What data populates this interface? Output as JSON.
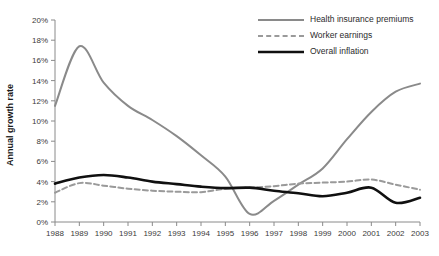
{
  "chart_data": {
    "type": "line",
    "title": "",
    "xlabel": "",
    "ylabel": "Annual growth rate",
    "x": [
      1988,
      1989,
      1990,
      1991,
      1992,
      1993,
      1994,
      1995,
      1996,
      1997,
      1998,
      1999,
      2000,
      2001,
      2002,
      2003
    ],
    "xtick_labels": [
      "1988",
      "1989",
      "1990",
      "1991",
      "1992",
      "1993",
      "1994",
      "1995",
      "1996",
      "1997",
      "1998",
      "1999",
      "2000",
      "2001",
      "2002",
      "2003"
    ],
    "ytick_labels": [
      "0%",
      "2%",
      "4%",
      "6%",
      "8%",
      "10%",
      "12%",
      "14%",
      "16%",
      "18%",
      "20%"
    ],
    "ytick_values": [
      0,
      2,
      4,
      6,
      8,
      10,
      12,
      14,
      16,
      18,
      20
    ],
    "ylim": [
      0,
      20
    ],
    "xlim": [
      1988,
      2003
    ],
    "grid": false,
    "legend_position": "top-right",
    "series": [
      {
        "name": "Health insurance premiums",
        "style": "solid",
        "color": "#8a8a8a",
        "width": 2.0,
        "values": [
          11.5,
          17.4,
          13.8,
          11.5,
          10.1,
          8.5,
          6.6,
          4.5,
          0.8,
          2.1,
          3.7,
          5.3,
          8.2,
          10.9,
          12.9,
          13.7
        ]
      },
      {
        "name": "Worker earnings",
        "style": "dashed",
        "color": "#9a9a9a",
        "width": 2.0,
        "values": [
          2.9,
          3.85,
          3.6,
          3.3,
          3.1,
          3.0,
          2.95,
          3.3,
          3.4,
          3.55,
          3.8,
          3.9,
          4.0,
          4.2,
          3.7,
          3.2
        ]
      },
      {
        "name": "Overall inflation",
        "style": "solid",
        "color": "#101010",
        "width": 2.6,
        "values": [
          3.8,
          4.4,
          4.65,
          4.4,
          4.0,
          3.75,
          3.5,
          3.35,
          3.4,
          3.1,
          2.85,
          2.55,
          2.9,
          3.4,
          1.9,
          2.4
        ]
      }
    ],
    "legend": [
      {
        "label": "Health insurance premiums",
        "style": "solid",
        "color": "#8a8a8a",
        "width": 2.0
      },
      {
        "label": "Worker earnings",
        "style": "dashed",
        "color": "#9a9a9a",
        "width": 2.0
      },
      {
        "label": "Overall inflation",
        "style": "solid",
        "color": "#101010",
        "width": 2.6
      }
    ]
  },
  "geometry": {
    "plot_left": 55,
    "plot_right": 420,
    "plot_top": 20,
    "plot_bottom": 222,
    "legend_line_x1": 258,
    "legend_line_x2": 304,
    "legend_text_x": 310,
    "legend_rows_y": [
      20,
      36,
      52
    ],
    "ylabel_x": 13,
    "ylabel_y": 125,
    "xtick_label_y": 236
  }
}
